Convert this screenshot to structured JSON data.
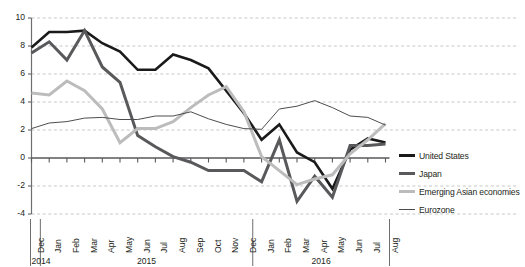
{
  "chart_data": {
    "type": "line",
    "title": "",
    "subtitle": "",
    "xlabel": "",
    "ylabel": "",
    "ylim": [
      -4,
      10
    ],
    "yticks": [
      -4,
      -2,
      0,
      2,
      4,
      6,
      8,
      10
    ],
    "ytick_labels": [
      "-4",
      "-2",
      "0",
      "2",
      "4",
      "6",
      "8",
      "10"
    ],
    "grid": true,
    "grid_axis": "y",
    "legend_position": "right",
    "x": [
      "Dec",
      "Jan",
      "Feb",
      "Mar",
      "Apr",
      "May",
      "Jun",
      "Jul",
      "Aug",
      "Sep",
      "Oct",
      "Nov",
      "Dec",
      "Jan",
      "Feb",
      "Mar",
      "Apr",
      "May",
      "Jun",
      "Jul",
      "Aug"
    ],
    "categories": [
      "Dec",
      "Jan",
      "Feb",
      "Mar",
      "Apr",
      "May",
      "Jun",
      "Jul",
      "Aug",
      "Sep",
      "Oct",
      "Nov",
      "Dec",
      "Jan",
      "Feb",
      "Mar",
      "Apr",
      "May",
      "Jun",
      "Jul",
      "Aug"
    ],
    "year_groups": [
      {
        "label": "2014",
        "start": 0,
        "end": 0
      },
      {
        "label": "2015",
        "start": 1,
        "end": 12
      },
      {
        "label": "2016",
        "start": 13,
        "end": 20
      }
    ],
    "series": [
      {
        "name": "United States",
        "color": "#1a1a1a",
        "width": 2.6,
        "values": [
          7.9,
          9.0,
          9.0,
          9.1,
          8.2,
          7.6,
          6.3,
          6.3,
          7.4,
          7.0,
          6.4,
          4.8,
          3.2,
          1.3,
          2.4,
          0.4,
          -0.3,
          -2.2,
          0.6,
          1.4,
          1.1
        ]
      },
      {
        "name": "Japan",
        "color": "#59595b",
        "width": 3.0,
        "values": [
          7.5,
          8.3,
          7.0,
          9.1,
          6.5,
          5.4,
          1.6,
          0.8,
          0.1,
          -0.3,
          -0.9,
          -0.9,
          -0.9,
          -1.7,
          1.3,
          -3.1,
          -1.3,
          -2.8,
          0.9,
          0.9,
          1.0
        ]
      },
      {
        "name": "Emerging Asian economies",
        "color": "#bcbcbc",
        "width": 3.0,
        "values": [
          4.65,
          4.5,
          5.5,
          4.8,
          3.5,
          1.1,
          2.1,
          2.1,
          2.6,
          3.6,
          4.5,
          5.1,
          3.3,
          0.1,
          -0.9,
          -1.9,
          -1.5,
          -1.2,
          0.3,
          1.3,
          2.45
        ]
      },
      {
        "name": "Eurozone",
        "color": "#4d4d4f",
        "width": 1.0,
        "values": [
          2.1,
          2.5,
          2.6,
          2.85,
          2.9,
          2.75,
          2.75,
          3.0,
          3.0,
          3.3,
          2.8,
          2.4,
          2.1,
          2.05,
          3.5,
          3.7,
          4.1,
          3.6,
          3.0,
          2.9,
          2.35
        ]
      }
    ]
  },
  "legend": {
    "items": [
      {
        "label": "United States"
      },
      {
        "label": "Japan"
      },
      {
        "label": "Emerging Asian economies"
      },
      {
        "label": "Eurozone"
      }
    ]
  }
}
